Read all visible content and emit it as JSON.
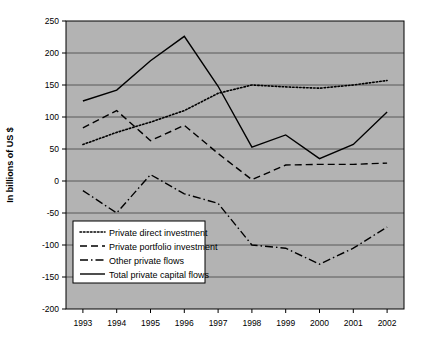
{
  "chart_data": {
    "type": "line",
    "title": "",
    "xlabel": "",
    "ylabel": "In billions of US $",
    "categories": [
      "1993",
      "1994",
      "1995",
      "1996",
      "1997",
      "1998",
      "1999",
      "2000",
      "2001",
      "2002"
    ],
    "ylim": [
      -200,
      250
    ],
    "ytick_step": 50,
    "yticks": [
      250,
      200,
      150,
      100,
      50,
      0,
      -50,
      -100,
      -150,
      -200
    ],
    "grid": true,
    "legend_position": "lower-left-inside",
    "plot_background": "#b3b3b3",
    "line_color": "#000000",
    "series": [
      {
        "name": "Private direct investment",
        "style": "dotted",
        "values": [
          57,
          76,
          92,
          110,
          137,
          150,
          147,
          145,
          150,
          157
        ]
      },
      {
        "name": "Private portfolio investment",
        "style": "dashed",
        "values": [
          83,
          110,
          63,
          87,
          43,
          2,
          25,
          26,
          26,
          28
        ]
      },
      {
        "name": "Other private flows",
        "style": "dash-dot",
        "values": [
          -15,
          -50,
          10,
          -20,
          -35,
          -100,
          -105,
          -130,
          -105,
          -72
        ]
      },
      {
        "name": "Total private capital flows",
        "style": "solid",
        "values": [
          125,
          142,
          188,
          226,
          148,
          53,
          72,
          35,
          57,
          108
        ]
      }
    ]
  },
  "legend": {
    "entries": [
      {
        "label": "Private direct investment",
        "style": "dotted"
      },
      {
        "label": "Private portfolio investment",
        "style": "dashed"
      },
      {
        "label": "Other private flows",
        "style": "dash-dot"
      },
      {
        "label": "Total private capital flows",
        "style": "solid"
      }
    ]
  }
}
